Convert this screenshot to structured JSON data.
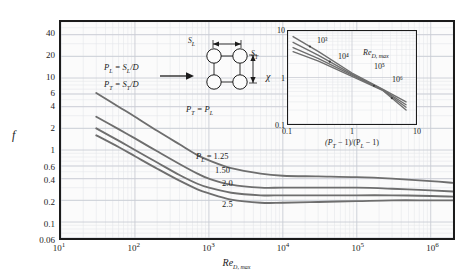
{
  "chart_data": {
    "type": "line",
    "title": "",
    "xlabel": "Re_D,max",
    "ylabel": "f",
    "xscale": "log",
    "yscale": "log",
    "xlim": [
      10,
      2000000
    ],
    "ylim": [
      0.06,
      60
    ],
    "grid": true,
    "legend_position": "inline-labels",
    "xticks": [
      "10",
      "100",
      "1000",
      "10000",
      "100000",
      "1000000"
    ],
    "xtick_labels": [
      "10¹",
      "10²",
      "10³",
      "10⁴",
      "10⁵",
      "10⁶"
    ],
    "ytick_labels": [
      "40",
      "20",
      "10",
      "6",
      "4",
      "2",
      "1",
      "0.6",
      "0.4",
      "0.2",
      "0.1",
      "0.06"
    ],
    "ytick_values": [
      40,
      20,
      10,
      6,
      4,
      2,
      1,
      0.6,
      0.4,
      0.2,
      0.1,
      0.06
    ],
    "series": [
      {
        "name": "P_L = 1.25",
        "label": "1.25",
        "x": [
          30,
          60,
          100,
          200,
          400,
          700,
          1000,
          2000,
          5000,
          10000,
          30000,
          100000,
          300000,
          1000000,
          2000000
        ],
        "values": [
          6.2,
          4.0,
          2.9,
          1.85,
          1.2,
          0.85,
          0.72,
          0.56,
          0.47,
          0.44,
          0.43,
          0.42,
          0.4,
          0.37,
          0.35
        ]
      },
      {
        "name": "P_L = 1.50",
        "label": "1.50",
        "x": [
          30,
          60,
          100,
          200,
          400,
          700,
          1000,
          2000,
          5000,
          10000,
          30000,
          100000,
          300000,
          1000000,
          2000000
        ],
        "values": [
          2.9,
          1.95,
          1.45,
          0.96,
          0.64,
          0.47,
          0.4,
          0.33,
          0.3,
          0.3,
          0.3,
          0.3,
          0.29,
          0.275,
          0.265
        ]
      },
      {
        "name": "P_L = 2.0",
        "label": "2.0",
        "x": [
          30,
          60,
          100,
          200,
          400,
          700,
          1000,
          2000,
          5000,
          10000,
          30000,
          100000,
          300000,
          1000000,
          2000000
        ],
        "values": [
          2.0,
          1.35,
          1.0,
          0.67,
          0.45,
          0.34,
          0.3,
          0.255,
          0.235,
          0.235,
          0.235,
          0.235,
          0.235,
          0.23,
          0.225
        ]
      },
      {
        "name": "P_L = 2.5",
        "label": "2.5",
        "x": [
          30,
          60,
          100,
          200,
          400,
          700,
          1000,
          2000,
          5000,
          10000,
          30000,
          100000,
          300000,
          1000000,
          2000000
        ],
        "values": [
          1.6,
          1.1,
          0.82,
          0.55,
          0.375,
          0.285,
          0.25,
          0.205,
          0.185,
          0.185,
          0.19,
          0.195,
          0.2,
          0.2,
          0.2
        ]
      }
    ],
    "inset": {
      "type": "line",
      "xlabel": "(P_T - 1)/(P_L - 1)",
      "ylabel": "chi",
      "xscale": "log",
      "yscale": "log",
      "xlim": [
        0.1,
        10
      ],
      "ylim": [
        0.1,
        10
      ],
      "grid": true,
      "xtick_labels": [
        "0.1",
        "1",
        "10"
      ],
      "ytick_labels": [
        "10",
        "1",
        "0.1"
      ],
      "series": [
        {
          "name": "Re_D,max = 10^3",
          "label": "10³",
          "x": [
            0.12,
            0.3,
            1.0,
            3.0,
            7.0
          ],
          "values": [
            7.6,
            3.6,
            1.25,
            0.56,
            0.3
          ]
        },
        {
          "name": "Re_D,max = 10^4",
          "label": "10⁴",
          "x": [
            0.12,
            0.3,
            1.0,
            3.0,
            7.0
          ],
          "values": [
            5.7,
            3.0,
            1.18,
            0.55,
            0.26
          ]
        },
        {
          "name": "Re_D,max = 10^5",
          "label": "10⁵",
          "x": [
            0.12,
            0.3,
            1.0,
            3.0,
            7.0
          ],
          "values": [
            4.4,
            2.55,
            1.12,
            0.54,
            0.23
          ]
        },
        {
          "name": "Re_D,max = 10^6",
          "label": "10⁶",
          "x": [
            0.12,
            0.3,
            1.0,
            3.0,
            7.0
          ],
          "values": [
            3.6,
            2.25,
            1.06,
            0.53,
            0.2
          ]
        }
      ],
      "re_annotation": "Re"
    }
  },
  "axes": {
    "y_title": "f",
    "x_title_main": "Re",
    "x_title_sub": "D, max"
  },
  "annotations": {
    "p_l_def_lhs": "P",
    "p_l_def_sub": "L",
    "p_l_def_rhs": " = S",
    "p_l_def_rhs_sub": "L",
    "p_l_def_tail": "/D",
    "p_t_def_lhs": "P",
    "p_t_def_sub": "T",
    "p_t_def_rhs": " = S",
    "p_t_def_rhs_sub": "T",
    "p_t_def_tail": "/D",
    "equality": "P",
    "equality_sub1": "T",
    "equality_mid": " = P",
    "equality_sub2": "L",
    "dim_sl": "S",
    "dim_sl_sub": "L",
    "dim_st": "S",
    "dim_st_sub": "T",
    "curve_group_prefix": "P",
    "curve_group_sub": "L",
    "curve_group_eq": " = 1.25"
  },
  "inset_labels": {
    "chi": "χ",
    "re_main": "Re",
    "re_sub": "D, max",
    "x_title_a": "(P",
    "x_title_a_sub": "T",
    "x_title_b": " − 1)/(P",
    "x_title_b_sub": "L",
    "x_title_c": " − 1)"
  },
  "colors": {
    "curve": "#6e6e6e",
    "frame": "#1b1b1b",
    "grid_major": "#c9ccd4",
    "grid_minor": "#e5e7eb",
    "background": "#ffffff",
    "plot_background": "#fbfbfb"
  }
}
